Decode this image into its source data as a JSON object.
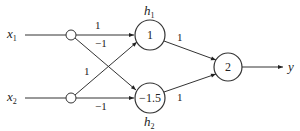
{
  "diagram": {
    "type": "neural-network",
    "inputs": [
      {
        "id": "x1",
        "label": "x",
        "sub": "1"
      },
      {
        "id": "x2",
        "label": "x",
        "sub": "2"
      }
    ],
    "hidden": [
      {
        "id": "h1",
        "label": "h",
        "sub": "1",
        "threshold": "1"
      },
      {
        "id": "h2",
        "label": "h",
        "sub": "2",
        "threshold": "−1.5"
      }
    ],
    "output": {
      "id": "out",
      "threshold": "2",
      "label": "y"
    },
    "weights": {
      "x1_h1": "1",
      "x1_h2": "−1",
      "x2_h1": "1",
      "x2_h2": "−1",
      "h1_out": "1",
      "h2_out": "1"
    },
    "colors": {
      "stroke": "#333333",
      "text": "#222222",
      "background": "#ffffff"
    }
  }
}
